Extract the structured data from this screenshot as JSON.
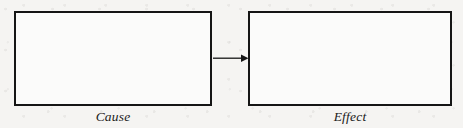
{
  "diagram": {
    "type": "cause-effect-flow",
    "orientation": "horizontal",
    "background_color": "#f5f4f2",
    "stroke_color": "#151515",
    "fill_color": "#fbfbfa",
    "nodes": [
      {
        "id": "cause",
        "label": "Cause",
        "label_style": "italic-serif",
        "shape": "rectangle"
      },
      {
        "id": "effect",
        "label": "Effect",
        "label_style": "italic-serif",
        "shape": "rectangle"
      }
    ],
    "connectors": [
      {
        "id": "cause-to-effect",
        "from": "cause",
        "to": "effect",
        "style": "solid",
        "arrowhead": "filled-triangle",
        "label": ""
      }
    ]
  }
}
